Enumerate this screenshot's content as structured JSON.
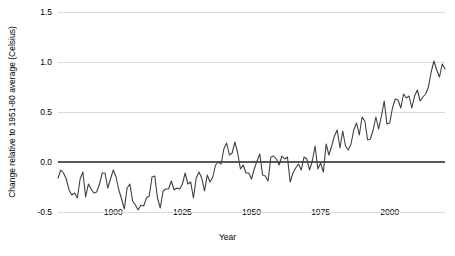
{
  "chart_data": {
    "type": "line",
    "title": "",
    "xlabel": "Year",
    "ylabel": "Change relative to 1951-80 average (Celsius)",
    "xlim": [
      1880,
      2020
    ],
    "ylim": [
      -0.5,
      1.5
    ],
    "xticks": [
      1900,
      1925,
      1950,
      1975,
      2000
    ],
    "xtick_labels": [
      "1900",
      "1925",
      "1950",
      "1975",
      "2000"
    ],
    "yticks": [
      -0.5,
      0.0,
      0.5,
      1.0,
      1.5
    ],
    "ytick_labels": [
      "-0.5",
      "0.0",
      "0.5",
      "1.0",
      "1.5"
    ],
    "grid": true,
    "grid_axis": "y",
    "legend": false,
    "zero_line": 0.0,
    "series_name": "Global mean temperature anomaly",
    "line_color": "#404040",
    "grid_color": "#d9d9d9",
    "zero_line_color": "#595959",
    "x": [
      1880,
      1881,
      1882,
      1883,
      1884,
      1885,
      1886,
      1887,
      1888,
      1889,
      1890,
      1891,
      1892,
      1893,
      1894,
      1895,
      1896,
      1897,
      1898,
      1899,
      1900,
      1901,
      1902,
      1903,
      1904,
      1905,
      1906,
      1907,
      1908,
      1909,
      1910,
      1911,
      1912,
      1913,
      1914,
      1915,
      1916,
      1917,
      1918,
      1919,
      1920,
      1921,
      1922,
      1923,
      1924,
      1925,
      1926,
      1927,
      1928,
      1929,
      1930,
      1931,
      1932,
      1933,
      1934,
      1935,
      1936,
      1937,
      1938,
      1939,
      1940,
      1941,
      1942,
      1943,
      1944,
      1945,
      1946,
      1947,
      1948,
      1949,
      1950,
      1951,
      1952,
      1953,
      1954,
      1955,
      1956,
      1957,
      1958,
      1959,
      1960,
      1961,
      1962,
      1963,
      1964,
      1965,
      1966,
      1967,
      1968,
      1969,
      1970,
      1971,
      1972,
      1973,
      1974,
      1975,
      1976,
      1977,
      1978,
      1979,
      1980,
      1981,
      1982,
      1983,
      1984,
      1985,
      1986,
      1987,
      1988,
      1989,
      1990,
      1991,
      1992,
      1993,
      1994,
      1995,
      1996,
      1997,
      1998,
      1999,
      2000,
      2001,
      2002,
      2003,
      2004,
      2005,
      2006,
      2007,
      2008,
      2009,
      2010,
      2011,
      2012,
      2013,
      2014,
      2015,
      2016,
      2017,
      2018,
      2019,
      2020
    ],
    "values": [
      -0.16,
      -0.08,
      -0.11,
      -0.17,
      -0.28,
      -0.33,
      -0.31,
      -0.36,
      -0.17,
      -0.1,
      -0.35,
      -0.22,
      -0.27,
      -0.31,
      -0.3,
      -0.22,
      -0.11,
      -0.11,
      -0.26,
      -0.17,
      -0.08,
      -0.15,
      -0.28,
      -0.37,
      -0.47,
      -0.26,
      -0.22,
      -0.39,
      -0.43,
      -0.48,
      -0.43,
      -0.44,
      -0.36,
      -0.34,
      -0.15,
      -0.14,
      -0.36,
      -0.46,
      -0.29,
      -0.27,
      -0.27,
      -0.19,
      -0.28,
      -0.26,
      -0.27,
      -0.22,
      -0.11,
      -0.22,
      -0.2,
      -0.36,
      -0.16,
      -0.1,
      -0.16,
      -0.29,
      -0.13,
      -0.2,
      -0.15,
      -0.03,
      0.0,
      -0.02,
      0.13,
      0.19,
      0.07,
      0.09,
      0.2,
      0.09,
      -0.07,
      -0.03,
      -0.11,
      -0.11,
      -0.17,
      -0.07,
      0.01,
      0.08,
      -0.13,
      -0.14,
      -0.19,
      0.05,
      0.06,
      0.03,
      -0.03,
      0.06,
      0.03,
      0.05,
      -0.2,
      -0.11,
      -0.06,
      -0.02,
      -0.08,
      0.05,
      0.03,
      -0.08,
      0.01,
      0.16,
      -0.07,
      -0.01,
      -0.1,
      0.18,
      0.07,
      0.16,
      0.26,
      0.32,
      0.14,
      0.31,
      0.16,
      0.12,
      0.18,
      0.32,
      0.39,
      0.27,
      0.45,
      0.41,
      0.22,
      0.23,
      0.32,
      0.45,
      0.33,
      0.46,
      0.61,
      0.38,
      0.39,
      0.54,
      0.63,
      0.62,
      0.54,
      0.68,
      0.64,
      0.66,
      0.54,
      0.66,
      0.72,
      0.61,
      0.65,
      0.68,
      0.75,
      0.9,
      1.01,
      0.92,
      0.85,
      0.98,
      0.93
    ]
  },
  "axis": {
    "y_title": "Change relative to 1951-80 average (Celsius)",
    "x_title": "Year"
  }
}
